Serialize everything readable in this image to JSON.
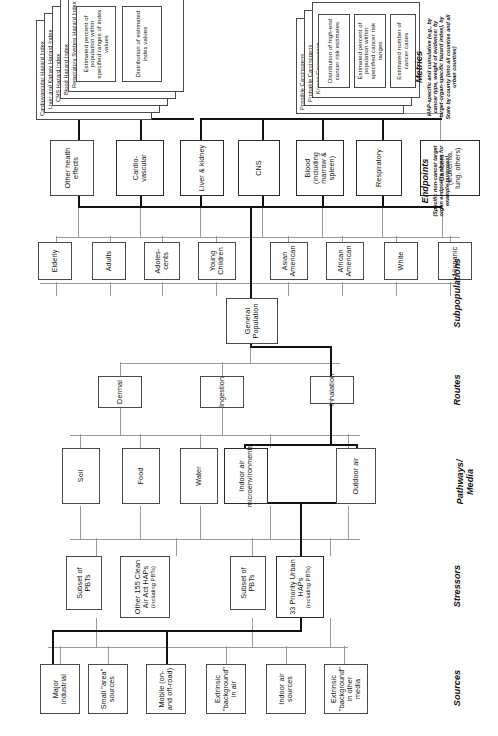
{
  "diagram": {
    "orientation": "rotated-90",
    "row_captions": [
      {
        "id": "sources",
        "label": "Sources",
        "note": ""
      },
      {
        "id": "stressors",
        "label": "Stressors",
        "note": ""
      },
      {
        "id": "pathways",
        "label": "Pathways/\nMedia",
        "note": ""
      },
      {
        "id": "routes",
        "label": "Routes",
        "note": ""
      },
      {
        "id": "subpopulations",
        "label": "Subpopulations",
        "note": ""
      },
      {
        "id": "endpoints",
        "label": "Endpoints",
        "note": "(Specific non-cancer target organ endpoints shown for example purposes)"
      },
      {
        "id": "metrics",
        "label": "Metrics",
        "note": "HAP-specific and cumulative (e.g., by cancer type, weight of evidence; by target-organ-specific hazard index), by State by county (into all counties and all urban counties)"
      }
    ],
    "sources": [
      {
        "label": "Major industrial"
      },
      {
        "label": "Small \"area\" sources"
      },
      {
        "label": "Mobile (on- and off-road)"
      },
      {
        "label": "Extrinsic \"background\" in air"
      },
      {
        "label": "Indoor air sources"
      },
      {
        "label": "Extrinsic \"background\" in other media"
      }
    ],
    "stressors": [
      {
        "label": "33 Priority Urban HAPs",
        "sub": "(including PBTs)"
      },
      {
        "label": "Subset of PBTs",
        "sub": ""
      },
      {
        "label": "Other 155 Clean Air Act HAPs",
        "sub": "(including PBTs)"
      },
      {
        "label": "Subset of PBTs",
        "sub": ""
      }
    ],
    "pathways": [
      {
        "label": "Outdoor air"
      },
      {
        "label": "Indoor air microenvironments"
      },
      {
        "label": "Water"
      },
      {
        "label": "Food"
      },
      {
        "label": "Soil"
      }
    ],
    "routes": [
      {
        "label": "Inhalation"
      },
      {
        "label": "Ingestion"
      },
      {
        "label": "Dermal"
      }
    ],
    "general_population": {
      "label": "General Population"
    },
    "subpopulations": [
      {
        "label": "Hispanic"
      },
      {
        "label": "White"
      },
      {
        "label": "African American"
      },
      {
        "label": "Asian American"
      },
      {
        "label": "Young Children"
      },
      {
        "label": "Adoles- cents"
      },
      {
        "label": "Adults"
      },
      {
        "label": "Elderly"
      }
    ],
    "endpoints": [
      {
        "label": "Cancers (leukemia, lung, others)"
      },
      {
        "label": "Respiratory"
      },
      {
        "label": "Blood (including marrow & spleen)"
      },
      {
        "label": "CNS"
      },
      {
        "label": "Liver & kidney"
      },
      {
        "label": "Cardio- vascular"
      },
      {
        "label": "Other health effects"
      }
    ],
    "metrics_cancer_stack": [
      {
        "label": "Possible Carcinogens"
      },
      {
        "label": "Probable Carcinogens"
      },
      {
        "label": "Known Carcinogens"
      }
    ],
    "metrics_cancer_outputs": [
      {
        "label": "Distribution of high-end cancer risk estimates"
      },
      {
        "label": "Estimated percent of population within specified cancer risk ranges"
      },
      {
        "label": "Estimated number of cancer cases"
      }
    ],
    "metrics_hazard_stack": [
      {
        "label": "Cardiovascular Hazard Index"
      },
      {
        "label": "Liver and Kidney Hazard Index"
      },
      {
        "label": "CNS Hazard Index"
      },
      {
        "label": "Blood Hazard Index"
      },
      {
        "label": "Respiratory System Hazard Index"
      }
    ],
    "metrics_hazard_outputs": [
      {
        "label": "Distribution of estimated index values"
      },
      {
        "label": "Estimated percent of population within specified ranges of index values"
      }
    ],
    "colors": {
      "background": "#ffffff",
      "box_border": "#4a4a4a",
      "heavy_border": "#2b2b2b",
      "thin_line": "#9a9a9a",
      "thick_line": "#111111",
      "text": "#111111"
    }
  }
}
